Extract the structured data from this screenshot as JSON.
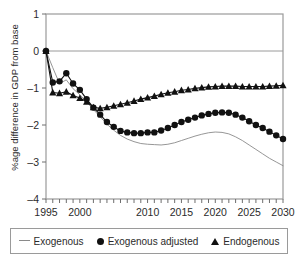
{
  "chart_data": {
    "type": "line",
    "title": "",
    "xlabel": "",
    "ylabel": "%age difference in GDP from base",
    "xlim": [
      1995,
      2030
    ],
    "ylim": [
      -4,
      1
    ],
    "yticks": [
      1,
      0,
      -1,
      -2,
      -3,
      -4
    ],
    "ytick_labels": [
      "1",
      "0",
      "–1",
      "–2",
      "–3",
      "–4"
    ],
    "xticks": [
      1995,
      1996,
      1997,
      1998,
      1999,
      2000,
      2001,
      2002,
      2003,
      2004,
      2005,
      2006,
      2007,
      2008,
      2009,
      2010,
      2011,
      2012,
      2013,
      2014,
      2015,
      2016,
      2017,
      2018,
      2019,
      2020,
      2021,
      2022,
      2023,
      2024,
      2025,
      2026,
      2027,
      2028,
      2029,
      2030
    ],
    "xtick_labels": [
      "1995",
      "",
      "",
      "",
      "",
      "2000",
      "",
      "",
      "",
      "",
      "",
      "",
      "",
      "",
      "",
      "2010",
      "",
      "",
      "",
      "",
      "2015",
      "",
      "",
      "",
      "",
      "2020",
      "",
      "",
      "",
      "",
      "2025",
      "",
      "",
      "",
      "",
      "2030"
    ],
    "grid": false,
    "legend_position": "bottom",
    "x": [
      1995,
      1996,
      1997,
      1998,
      1999,
      2000,
      2001,
      2002,
      2003,
      2004,
      2005,
      2006,
      2007,
      2008,
      2009,
      2010,
      2011,
      2012,
      2013,
      2014,
      2015,
      2016,
      2017,
      2018,
      2019,
      2020,
      2021,
      2022,
      2023,
      2024,
      2025,
      2026,
      2027,
      2028,
      2029,
      2030
    ],
    "series": [
      {
        "name": "Exogenous",
        "marker": "none",
        "color": "#8a8a8a",
        "values": [
          0.0,
          -0.45,
          -0.88,
          -0.78,
          -1.02,
          -1.18,
          -1.38,
          -1.58,
          -1.78,
          -1.98,
          -2.14,
          -2.28,
          -2.38,
          -2.45,
          -2.5,
          -2.52,
          -2.53,
          -2.54,
          -2.52,
          -2.48,
          -2.42,
          -2.36,
          -2.3,
          -2.25,
          -2.21,
          -2.19,
          -2.2,
          -2.24,
          -2.32,
          -2.42,
          -2.54,
          -2.66,
          -2.78,
          -2.9,
          -3.0,
          -3.1
        ]
      },
      {
        "name": "Exogenous adjusted",
        "marker": "circle",
        "color": "#111111",
        "values": [
          0.0,
          -0.85,
          -0.82,
          -0.6,
          -0.88,
          -1.05,
          -1.3,
          -1.53,
          -1.72,
          -1.92,
          -2.05,
          -2.16,
          -2.2,
          -2.22,
          -2.22,
          -2.2,
          -2.2,
          -2.15,
          -2.08,
          -2.0,
          -1.92,
          -1.86,
          -1.8,
          -1.74,
          -1.7,
          -1.67,
          -1.66,
          -1.67,
          -1.72,
          -1.8,
          -1.9,
          -2.0,
          -2.08,
          -2.18,
          -2.28,
          -2.38
        ]
      },
      {
        "name": "Endogenous",
        "marker": "triangle",
        "color": "#111111",
        "values": [
          0.0,
          -1.12,
          -1.14,
          -1.1,
          -1.2,
          -1.27,
          -1.37,
          -1.52,
          -1.55,
          -1.52,
          -1.48,
          -1.44,
          -1.4,
          -1.35,
          -1.3,
          -1.26,
          -1.22,
          -1.17,
          -1.13,
          -1.1,
          -1.06,
          -1.04,
          -1.01,
          -0.99,
          -0.97,
          -0.96,
          -0.95,
          -0.95,
          -0.95,
          -0.96,
          -0.96,
          -0.96,
          -0.96,
          -0.95,
          -0.94,
          -0.93
        ]
      }
    ]
  },
  "legend": {
    "items": [
      {
        "label": "Exogenous",
        "marker": "line"
      },
      {
        "label": "Exogenous adjusted",
        "marker": "circle"
      },
      {
        "label": "Endogenous",
        "marker": "triangle"
      }
    ]
  }
}
